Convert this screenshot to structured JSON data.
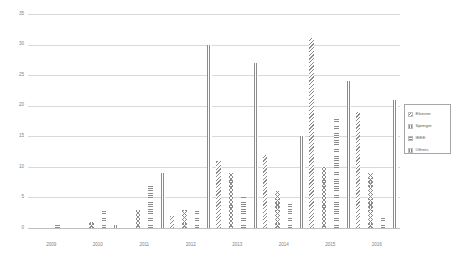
{
  "chart_data": {
    "type": "bar",
    "title": "",
    "xlabel": "",
    "ylabel": "",
    "ylim": [
      0,
      35
    ],
    "yticks": [
      0,
      5,
      10,
      15,
      20,
      25,
      30,
      35
    ],
    "grid": true,
    "legend_position": "right",
    "categories": [
      "2009",
      "2010",
      "2011",
      "2012",
      "2013",
      "2014",
      "2015",
      "2016"
    ],
    "series": [
      {
        "name": "Elsevier",
        "pattern": "back-diagonal-hatch",
        "values": [
          0,
          0,
          0,
          2,
          11,
          12,
          31,
          19
        ]
      },
      {
        "name": "Springer",
        "pattern": "chevron-hatch",
        "values": [
          0,
          1,
          3,
          3,
          9,
          6,
          10,
          9
        ]
      },
      {
        "name": "IEEE",
        "pattern": "horizontal-lines",
        "values": [
          0.5,
          3,
          7,
          3,
          5,
          4,
          18,
          2
        ]
      },
      {
        "name": "Others",
        "pattern": "vertical-lines",
        "values": [
          0,
          0.5,
          9,
          30,
          27,
          15,
          24,
          21
        ]
      }
    ]
  },
  "legend": {
    "items": [
      {
        "label": "Elsevier"
      },
      {
        "label": "Springer"
      },
      {
        "label": "IEEE"
      },
      {
        "label": "Others"
      }
    ]
  },
  "colors": {
    "hatch": "#8c8c8c",
    "gridline": "#d9d9d9",
    "tick_text": "#7f7f7f",
    "legend_border": "#a6a6a6",
    "background": "#ffffff"
  }
}
